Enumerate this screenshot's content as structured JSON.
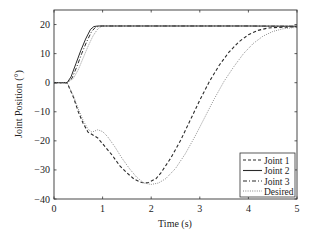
{
  "chart_data": {
    "type": "line",
    "title": "",
    "xlabel": "Time (s)",
    "ylabel": "Joint Position (°)",
    "xlim": [
      0,
      5
    ],
    "ylim": [
      -40,
      25
    ],
    "xticks": [
      0,
      1,
      2,
      3,
      4,
      5
    ],
    "yticks": [
      -40,
      -30,
      -20,
      -10,
      0,
      10,
      20
    ],
    "grid": false,
    "legend_position": "lower right",
    "legend": [
      "Joint 1",
      "Joint 2",
      "Joint 3",
      "Desired"
    ],
    "series": [
      {
        "name": "Joint 1",
        "style": "dashed",
        "x": [
          0,
          0.27,
          0.4,
          0.5,
          0.6,
          0.7,
          0.8,
          0.9,
          1.05,
          1.2,
          1.35,
          1.5,
          1.65,
          1.8,
          1.87,
          1.95,
          2.1,
          2.2,
          2.4,
          2.6,
          2.8,
          3.0,
          3.2,
          3.4,
          3.6,
          3.8,
          4.0,
          4.2,
          4.4,
          4.6,
          4.8,
          5.0
        ],
        "values": [
          0,
          0,
          -5,
          -10,
          -14,
          -17,
          -18,
          -19,
          -22,
          -25,
          -28.5,
          -31,
          -33.2,
          -34.3,
          -34.5,
          -34.3,
          -33,
          -31,
          -26,
          -20,
          -13,
          -6,
          0.5,
          6,
          10.5,
          14,
          16.5,
          18,
          18.8,
          19,
          19.1,
          19.2
        ]
      },
      {
        "name": "Joint 2",
        "style": "solid",
        "x": [
          0,
          0.27,
          0.35,
          0.45,
          0.55,
          0.65,
          0.75,
          0.82,
          0.9,
          1.0,
          1.5,
          2.0,
          3.0,
          4.0,
          5.0
        ],
        "values": [
          0,
          0,
          2,
          6.5,
          11,
          15,
          18.3,
          19.3,
          19.5,
          19.5,
          19.5,
          19.5,
          19.5,
          19.5,
          19.4
        ]
      },
      {
        "name": "Joint 3",
        "style": "dashdot",
        "x": [
          0,
          0.27,
          0.37,
          0.47,
          0.57,
          0.67,
          0.77,
          0.85,
          0.92,
          1.0,
          1.5,
          2.0,
          3.0,
          4.0,
          5.0
        ],
        "values": [
          0,
          0,
          1.5,
          5.5,
          10,
          14,
          17.5,
          19,
          19.4,
          19.5,
          19.5,
          19.5,
          19.5,
          19.5,
          19.4
        ]
      },
      {
        "name": "Desired (upper)",
        "style": "dotted",
        "x": [
          0,
          0.27,
          0.4,
          0.5,
          0.6,
          0.7,
          0.8,
          0.9,
          0.97,
          1.05,
          1.5,
          2.0,
          3.0,
          4.0,
          5.0
        ],
        "values": [
          0,
          0,
          1.5,
          4.5,
          8.5,
          12.5,
          16,
          18.5,
          19.3,
          19.5,
          19.5,
          19.5,
          19.5,
          19.5,
          19.5
        ]
      },
      {
        "name": "Desired (lower)",
        "style": "dotted",
        "x": [
          0,
          0.27,
          0.4,
          0.5,
          0.6,
          0.7,
          0.78,
          0.9,
          1.0,
          1.1,
          1.25,
          1.4,
          1.55,
          1.7,
          1.85,
          2.0,
          2.15,
          2.3,
          2.5,
          2.7,
          2.9,
          3.1,
          3.3,
          3.5,
          3.7,
          3.9,
          4.1,
          4.3,
          4.5,
          4.7,
          4.9,
          5.0
        ],
        "values": [
          0,
          0,
          -4.5,
          -9,
          -13,
          -16,
          -17,
          -16.2,
          -16.8,
          -18.5,
          -22,
          -26,
          -29.5,
          -32.5,
          -34.5,
          -35,
          -34.5,
          -33,
          -29.5,
          -24.5,
          -18.5,
          -12,
          -5.5,
          0.5,
          5.5,
          10,
          13.5,
          16,
          17.6,
          18.5,
          18.9,
          19
        ]
      }
    ]
  },
  "colors": {
    "line": "#2a2a2a",
    "desired": "#777777",
    "axis": "#333333",
    "background": "#ffffff"
  },
  "labels": {
    "xlabel": "Time (s)",
    "ylabel": "Joint Position (°)",
    "legend": [
      "Joint 1",
      "Joint 2",
      "Joint 3",
      "Desired"
    ]
  }
}
